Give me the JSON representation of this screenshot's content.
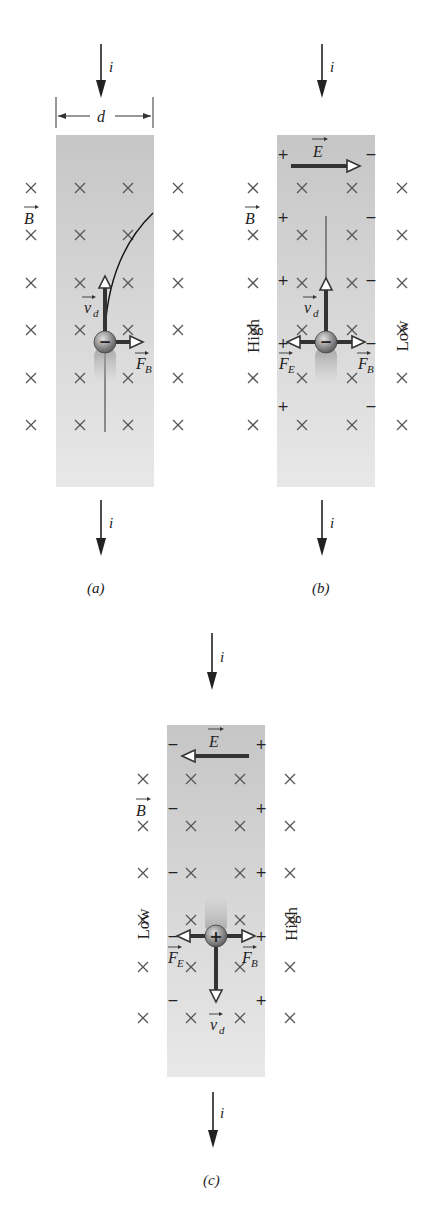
{
  "diagram": {
    "topic": "Hall effect",
    "colors": {
      "strip_top": "#c9c9c9",
      "strip_bottom": "#e6e6e6",
      "cross": "#555555",
      "arrow": "#333333",
      "text": "#222222"
    },
    "panels": [
      {
        "id": "a",
        "label": "(a)",
        "current_label": "i",
        "width_label": "d",
        "field_label": "B",
        "carrier_sign": "−",
        "drift_label": "v",
        "drift_sub": "d",
        "magnetic_force_label": "F",
        "magnetic_force_sub": "B"
      },
      {
        "id": "b",
        "label": "(b)",
        "current_label": "i",
        "electric_field_label": "E",
        "field_label": "B",
        "carrier_sign": "−",
        "drift_label": "v",
        "drift_sub": "d",
        "magnetic_force_label": "F",
        "magnetic_force_sub": "B",
        "electric_force_label": "F",
        "electric_force_sub": "E",
        "left_side_charge": "+",
        "right_side_charge": "−",
        "left_potential": "High",
        "right_potential": "Low"
      },
      {
        "id": "c",
        "label": "(c)",
        "current_label": "i",
        "electric_field_label": "E",
        "field_label": "B",
        "carrier_sign": "+",
        "drift_label": "v",
        "drift_sub": "d",
        "magnetic_force_label": "F",
        "magnetic_force_sub": "B",
        "electric_force_label": "F",
        "electric_force_sub": "E",
        "left_side_charge": "−",
        "right_side_charge": "+",
        "left_potential": "Low",
        "right_potential": "High"
      }
    ],
    "cross_symbol": "×"
  }
}
